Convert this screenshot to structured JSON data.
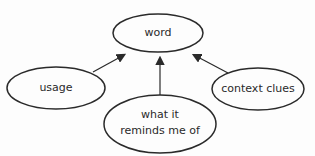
{
  "diagram": {
    "type": "concept-map",
    "nodes": [
      {
        "id": "word",
        "label": "word"
      },
      {
        "id": "usage",
        "label": "usage"
      },
      {
        "id": "context",
        "label": "context clues"
      },
      {
        "id": "reminds",
        "label_line1": "what it",
        "label_line2": "reminds me of"
      }
    ],
    "edges": [
      {
        "from": "usage",
        "to": "word"
      },
      {
        "from": "reminds",
        "to": "word"
      },
      {
        "from": "context",
        "to": "word"
      }
    ],
    "colors": {
      "stroke": "#2a2a2a",
      "background": "#fdfdfd"
    }
  }
}
